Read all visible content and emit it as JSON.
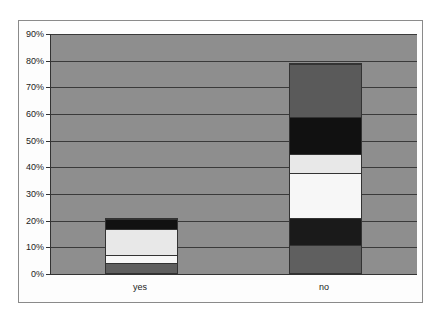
{
  "chart_data": {
    "type": "bar",
    "stacked": true,
    "title": "",
    "xlabel": "",
    "ylabel": "",
    "ylim": [
      0,
      90
    ],
    "yticks": [
      "0%",
      "10%",
      "20%",
      "30%",
      "40%",
      "50%",
      "60%",
      "70%",
      "80%",
      "90%"
    ],
    "grid": true,
    "legend": "none",
    "categories": [
      "yes",
      "no"
    ],
    "series": [
      {
        "name": "segment 1",
        "color": "#5f5f5f",
        "values": [
          4,
          10.5
        ]
      },
      {
        "name": "segment 2",
        "color": "#1a1a1a",
        "values": [
          0,
          10.5
        ]
      },
      {
        "name": "segment 3",
        "color": "#f7f7f7",
        "values": [
          3,
          17
        ]
      },
      {
        "name": "segment 4",
        "color": "#e8e8e8",
        "values": [
          10,
          7
        ]
      },
      {
        "name": "segment 5",
        "color": "#111111",
        "values": [
          4,
          14
        ]
      },
      {
        "name": "segment 6",
        "color": "#5a5a5a",
        "values": [
          0,
          20
        ]
      }
    ],
    "totals": [
      21,
      79
    ]
  }
}
